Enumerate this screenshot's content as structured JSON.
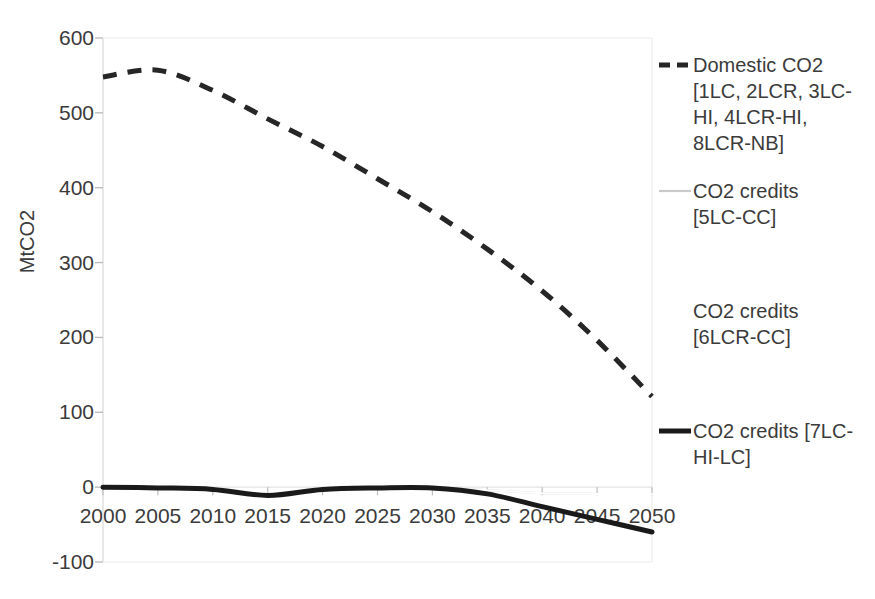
{
  "chart_data": {
    "type": "line",
    "title": "",
    "xlabel": "",
    "ylabel": "MtCO2",
    "xlim": [
      2000,
      2050
    ],
    "ylim": [
      -100,
      600
    ],
    "ytick_step": 100,
    "xtick_step": 5,
    "grid": false,
    "legend_position": "right",
    "x": [
      2000,
      2005,
      2010,
      2015,
      2020,
      2025,
      2030,
      2035,
      2040,
      2045,
      2050
    ],
    "xticklabels": [
      "2000",
      "2005",
      "2010",
      "2015",
      "2020",
      "2025",
      "2030",
      "2035",
      "2040",
      "2045",
      "2050"
    ],
    "yticklabels": [
      "600",
      "500",
      "400",
      "300",
      "200",
      "100",
      "0",
      "-100"
    ],
    "ytickvalues": [
      600,
      500,
      400,
      300,
      200,
      100,
      0,
      -100
    ],
    "series": [
      {
        "name": "Domestic CO2 [1LC, 2LCR, 3LC-HI, 4LCR-HI, 8LCR-NB]",
        "style": "dashed",
        "color": "#262626",
        "width": 5,
        "values": [
          548,
          557,
          530,
          492,
          455,
          412,
          368,
          318,
          262,
          196,
          121
        ]
      },
      {
        "name": "CO2 credits [5LC-CC]",
        "style": "solid",
        "color": "#c9c9c9",
        "width": 2,
        "values": [
          0,
          -1,
          -3,
          -11,
          -3,
          -1,
          -1,
          -4,
          -8,
          -9,
          -9
        ]
      },
      {
        "name": "CO2 credits [6LCR-CC]",
        "style": "solid",
        "color": "#ffffff",
        "width": 2,
        "values": [
          0,
          -1,
          -3,
          -11,
          -3,
          -1,
          -1,
          -4,
          -8,
          -9,
          -9
        ]
      },
      {
        "name": "CO2 credits [7LC-HI-LC]",
        "style": "solid",
        "color": "#1a1a1a",
        "width": 5,
        "values": [
          0,
          -1,
          -3,
          -11,
          -3,
          -1,
          -1,
          -9,
          -26,
          -43,
          -60
        ]
      }
    ]
  },
  "axes": {
    "y_title": "MtCO2"
  },
  "legend": {
    "entries": [
      {
        "label": "Domestic CO2\n[1LC, 2LCR, 3LC-\nHI, 4LCR-HI,\n8LCR-NB]",
        "marker": "dashed-line",
        "color": "#262626"
      },
      {
        "label": "CO2 credits\n[5LC-CC]",
        "marker": "solid-line-thin",
        "color": "#c9c9c9"
      },
      {
        "label": "CO2 credits\n[6LCR-CC]",
        "marker": "solid-line-blank",
        "color": "#ffffff"
      },
      {
        "label": "CO2 credits [7LC-\nHI-LC]",
        "marker": "solid-line-thick",
        "color": "#1a1a1a"
      }
    ]
  }
}
